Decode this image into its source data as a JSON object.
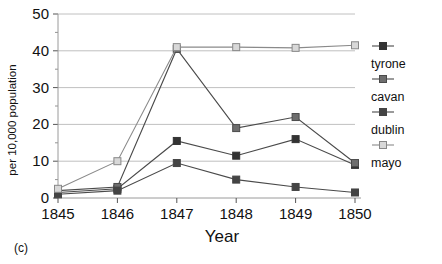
{
  "caption": "(c)",
  "chart_data": {
    "type": "line",
    "title": "",
    "xlabel": "Year",
    "ylabel": "per 10,000 population",
    "categories": [
      "1845",
      "1846",
      "1847",
      "1848",
      "1849",
      "1850"
    ],
    "x": [
      1845,
      1846,
      1847,
      1848,
      1849,
      1850
    ],
    "xlim": [
      1845,
      1850
    ],
    "ylim": [
      0,
      50
    ],
    "yticks": [
      0,
      10,
      20,
      30,
      40,
      50
    ],
    "xticks": [
      "1845",
      "1846",
      "1847",
      "1848",
      "1849",
      "1850"
    ],
    "grid": true,
    "grid_axis": "y",
    "legend_position": "right",
    "series": [
      {
        "name": "tyrone",
        "values": [
          1.5,
          2.5,
          15.5,
          11.5,
          16.0,
          9.0
        ],
        "marker": "filled-square",
        "color": "#333333"
      },
      {
        "name": "cavan",
        "values": [
          2.0,
          3.0,
          40.5,
          19.0,
          22.0,
          9.5
        ],
        "marker": "gray-square",
        "color": "#5a5a5a"
      },
      {
        "name": "dublin",
        "values": [
          1.0,
          2.0,
          9.5,
          5.0,
          3.0,
          1.5
        ],
        "marker": "filled-square",
        "color": "#444444"
      },
      {
        "name": "mayo",
        "values": [
          2.5,
          10.0,
          41.0,
          41.0,
          40.8,
          41.5
        ],
        "marker": "open-square",
        "color": "#777777"
      }
    ]
  },
  "legend": {
    "entries": [
      {
        "label": "tyrone"
      },
      {
        "label": "cavan"
      },
      {
        "label": "dublin"
      },
      {
        "label": "mayo"
      }
    ]
  }
}
